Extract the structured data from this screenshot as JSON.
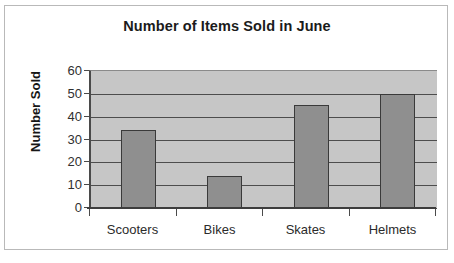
{
  "chart_data": {
    "type": "bar",
    "title": "Number of Items Sold in June",
    "xlabel": "",
    "ylabel": "Number Sold",
    "categories": [
      "Scooters",
      "Bikes",
      "Skates",
      "Helmets"
    ],
    "values": [
      34,
      14,
      45,
      50
    ],
    "ylim": [
      0,
      60
    ],
    "ytick_labels": [
      "60",
      "50",
      "40",
      "30",
      "20",
      "10",
      "0"
    ],
    "ytick_values": [
      60,
      50,
      40,
      30,
      20,
      10,
      0
    ],
    "ytick_step": 10,
    "grid": "horizontal",
    "legend": "none",
    "colors": {
      "bar_fill": "#8f8f8f",
      "bar_border": "#3a3a3a",
      "plot_background": "#c6c6c6",
      "gridline": "#4d4d4d",
      "axis": "#3d3d3d",
      "page_background": "#ffffff",
      "frame_border": "#b9b9b9",
      "title_text": "#1b1b1b",
      "tick_text": "#303030"
    }
  }
}
